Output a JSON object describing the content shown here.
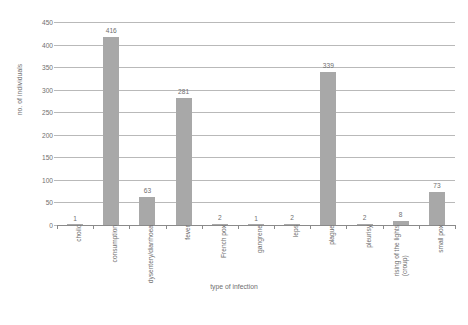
{
  "chart_data": {
    "type": "bar",
    "title": "",
    "xlabel": "type of infection",
    "ylabel": "no. of individuals",
    "ylim": [
      0,
      450
    ],
    "yticks": [
      0,
      50,
      100,
      150,
      200,
      250,
      300,
      350,
      400,
      450
    ],
    "grid": true,
    "legend": null,
    "bar_color": "#a8a8a8",
    "categories": [
      "choilc",
      "consumption",
      "dysentery/diarrhoea",
      "fever",
      "French pox",
      "gangrene",
      "leps",
      "plague",
      "pleurisy",
      "rising of the lights (croup)",
      "small pox"
    ],
    "category_lines": [
      [
        "choilc"
      ],
      [
        "consumption"
      ],
      [
        "dysentery/diarrhoea"
      ],
      [
        "fever"
      ],
      [
        "French pox"
      ],
      [
        "gangrene"
      ],
      [
        "leps"
      ],
      [
        "plague"
      ],
      [
        "pleurisy"
      ],
      [
        "rising of the lights",
        "(croup)"
      ],
      [
        "small pox"
      ]
    ],
    "values": [
      1,
      416,
      63,
      281,
      2,
      1,
      2,
      339,
      2,
      8,
      73
    ],
    "value_labels": [
      "1",
      "416",
      "63",
      "281",
      "2",
      "1",
      "2",
      "339",
      "2",
      "8",
      "73"
    ]
  }
}
